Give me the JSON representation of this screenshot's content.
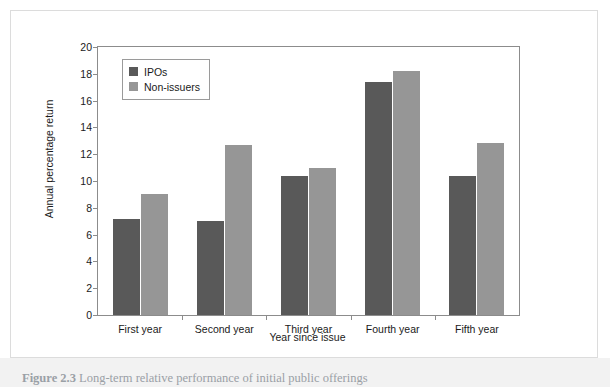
{
  "figure": {
    "caption_label": "Figure 2.3",
    "caption_text": "Long-term relative performance of initial public offerings"
  },
  "legend": {
    "position": "top-left-inside",
    "entries": [
      {
        "label": "IPOs",
        "color": "#595959"
      },
      {
        "label": "Non-issuers",
        "color": "#969696"
      }
    ]
  },
  "axes": {
    "y_title": "Annual percentage return",
    "x_title": "Year since issue",
    "y_ticks": [
      "0",
      "2",
      "4",
      "6",
      "8",
      "10",
      "12",
      "14",
      "16",
      "18",
      "20"
    ]
  },
  "chart_data": {
    "type": "bar",
    "title": "",
    "subtitle": "",
    "xlabel": "Year since issue",
    "ylabel": "Annual percentage return",
    "categories": [
      "First year",
      "Second year",
      "Third year",
      "Fourth year",
      "Fifth year"
    ],
    "series": [
      {
        "name": "IPOs",
        "color": "#595959",
        "values": [
          7.2,
          7.0,
          10.4,
          17.4,
          10.4
        ]
      },
      {
        "name": "Non-issuers",
        "color": "#969696",
        "values": [
          9.0,
          12.7,
          11.0,
          18.2,
          12.8
        ]
      }
    ],
    "ylim": [
      0,
      20
    ],
    "ytick_step": 2,
    "grid": false,
    "legend_position": "upper left"
  },
  "colors": {
    "ipos": "#595959",
    "non_issuers": "#969696",
    "axis": "#8c8c8c",
    "panel_border": "#dcdcdc",
    "page_strip": "#f2f2f2"
  }
}
